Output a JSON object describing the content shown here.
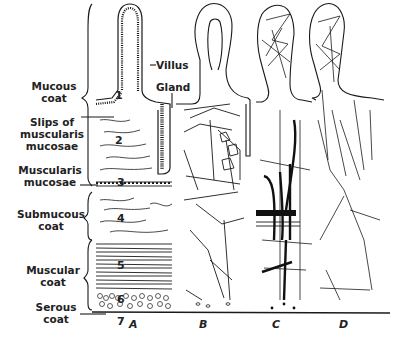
{
  "diagram": {
    "type": "anatomical-section",
    "colors": {
      "ink": "#1a1a1a",
      "background": "#ffffff",
      "fill_dark": "#111111"
    },
    "layer_labels": [
      {
        "id": "mucous-coat",
        "text": "Mucous coat",
        "line1": "Mucous",
        "line2": "coat"
      },
      {
        "id": "slips-muscularis-mucosae",
        "text": "Slips of muscularis mucosae",
        "line1": "Slips of",
        "line2": "muscularis",
        "line3": "mucosae"
      },
      {
        "id": "muscularis-mucosae",
        "text": "Muscularis mucosae",
        "line1": "Muscularis",
        "line2": "mucosae"
      },
      {
        "id": "submucous-coat",
        "text": "Submucous coat",
        "line1": "Submucous",
        "line2": "coat"
      },
      {
        "id": "muscular-coat",
        "text": "Muscular coat",
        "line1": "Muscular",
        "line2": "coat"
      },
      {
        "id": "serous-coat",
        "text": "Serous coat",
        "line1": "Serous",
        "line2": "coat"
      }
    ],
    "structure_labels": {
      "villus": "Villus",
      "gland": "Gland"
    },
    "layer_numbers": [
      "1",
      "2",
      "3",
      "4",
      "5",
      "6",
      "7"
    ],
    "panels": [
      "A",
      "B",
      "C",
      "D"
    ]
  }
}
